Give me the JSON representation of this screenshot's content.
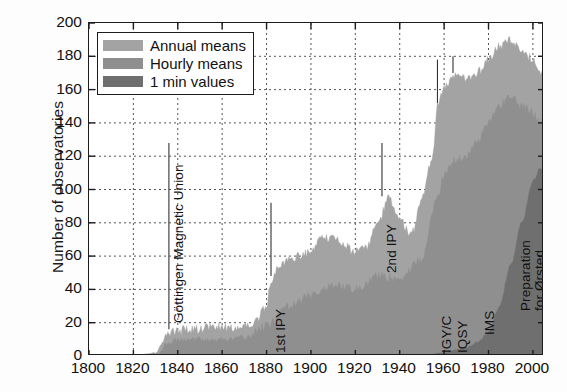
{
  "chart_data": {
    "type": "area",
    "title": "",
    "xlabel": "",
    "ylabel": "Number of observatories",
    "xlim": [
      1800,
      2005
    ],
    "ylim": [
      0,
      200
    ],
    "xticks": [
      1800,
      1820,
      1840,
      1860,
      1880,
      1900,
      1920,
      1940,
      1960,
      1980,
      2000
    ],
    "yticks": [
      0,
      20,
      40,
      60,
      80,
      100,
      120,
      140,
      160,
      180,
      200
    ],
    "grid": "dotted-both-axes",
    "legend_position": "upper-left-inside",
    "stacked": false,
    "series": [
      {
        "name": "Annual means",
        "color": "#a3a3a3",
        "x": [
          1800,
          1810,
          1820,
          1830,
          1836,
          1840,
          1845,
          1850,
          1855,
          1860,
          1865,
          1870,
          1875,
          1880,
          1882,
          1885,
          1890,
          1895,
          1900,
          1905,
          1910,
          1915,
          1920,
          1925,
          1930,
          1935,
          1940,
          1945,
          1950,
          1955,
          1957,
          1960,
          1964,
          1965,
          1970,
          1975,
          1980,
          1985,
          1990,
          1995,
          2000,
          2003
        ],
        "values": [
          0,
          0,
          0,
          2,
          14,
          15,
          16,
          16,
          17,
          17,
          17,
          18,
          20,
          30,
          45,
          52,
          58,
          60,
          62,
          70,
          72,
          66,
          62,
          66,
          78,
          95,
          82,
          72,
          95,
          120,
          150,
          160,
          168,
          170,
          165,
          170,
          178,
          186,
          190,
          182,
          178,
          170
        ]
      },
      {
        "name": "Hourly means",
        "color": "#8f8f8f",
        "x": [
          1800,
          1830,
          1836,
          1840,
          1850,
          1860,
          1870,
          1880,
          1890,
          1900,
          1910,
          1920,
          1930,
          1940,
          1950,
          1957,
          1960,
          1965,
          1970,
          1975,
          1980,
          1985,
          1990,
          1995,
          2000,
          2003
        ],
        "values": [
          0,
          0,
          8,
          9,
          10,
          10,
          11,
          18,
          30,
          36,
          42,
          40,
          48,
          46,
          58,
          95,
          108,
          118,
          120,
          128,
          140,
          150,
          156,
          150,
          146,
          142
        ]
      },
      {
        "name": "1 min values",
        "color": "#6f6f6f",
        "x": [
          1800,
          1950,
          1960,
          1970,
          1975,
          1980,
          1985,
          1990,
          1995,
          2000,
          2003
        ],
        "values": [
          0,
          0,
          2,
          5,
          8,
          14,
          30,
          55,
          80,
          105,
          112
        ]
      }
    ],
    "annotations": [
      {
        "text": "Göttingen Magnetic Union",
        "year": 1836,
        "orientation": "vertical"
      },
      {
        "text": "1st IPY",
        "year": 1882,
        "orientation": "vertical"
      },
      {
        "text": "2nd IPY",
        "year": 1932,
        "orientation": "vertical"
      },
      {
        "text": "IGY/C",
        "year": 1957,
        "orientation": "vertical"
      },
      {
        "text": "IQSY",
        "year": 1964,
        "orientation": "vertical"
      },
      {
        "text": "IMS",
        "year": 1976,
        "orientation": "vertical"
      },
      {
        "text": "Preparation",
        "text2": "for Ørsted",
        "year": 1993,
        "orientation": "vertical"
      }
    ]
  },
  "legend": {
    "items": [
      {
        "label": "Annual means",
        "color": "#a3a3a3"
      },
      {
        "label": "Hourly means",
        "color": "#8f8f8f"
      },
      {
        "label": "1 min values",
        "color": "#6f6f6f"
      }
    ]
  },
  "axes": {
    "y_title": "Number of observatories",
    "y_ticks": [
      "200",
      "180",
      "160",
      "140",
      "120",
      "100",
      "80",
      "60",
      "40",
      "20",
      "0"
    ],
    "x_ticks": [
      "1800",
      "1820",
      "1840",
      "1860",
      "1880",
      "1900",
      "1920",
      "1940",
      "1960",
      "1980",
      "2000"
    ]
  }
}
